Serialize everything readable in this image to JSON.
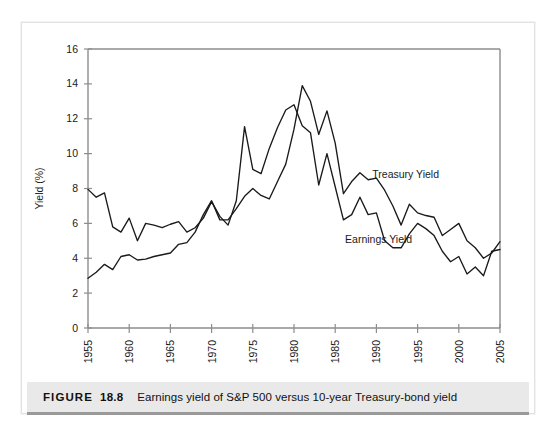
{
  "caption": {
    "figure_word": "FIGURE",
    "figure_number": "18.8",
    "text": "Earnings yield of S&P 500 versus 10-year Treasury-bond yield"
  },
  "chart_data": {
    "type": "line",
    "title": "",
    "xlabel": "",
    "ylabel": "Yield (%)",
    "xlim": [
      1955,
      2005
    ],
    "ylim": [
      0,
      16
    ],
    "yticks": [
      0,
      2,
      4,
      6,
      8,
      10,
      12,
      14,
      16
    ],
    "ytick_labels": [
      "0",
      "2",
      "4",
      "6",
      "8",
      "10",
      "12",
      "14",
      "16"
    ],
    "xticks": [
      1955,
      1960,
      1965,
      1970,
      1975,
      1980,
      1985,
      1990,
      1995,
      2000,
      2005
    ],
    "xtick_labels": [
      "1955",
      "1960",
      "1965",
      "1970",
      "1975",
      "1980",
      "1985",
      "1990",
      "1995",
      "2000",
      "2005"
    ],
    "grid": false,
    "legend": "inline-annotations",
    "x": [
      1955,
      1956,
      1957,
      1958,
      1959,
      1960,
      1961,
      1962,
      1963,
      1964,
      1965,
      1966,
      1967,
      1968,
      1969,
      1970,
      1971,
      1972,
      1973,
      1974,
      1975,
      1976,
      1977,
      1978,
      1979,
      1980,
      1981,
      1982,
      1983,
      1984,
      1985,
      1986,
      1987,
      1988,
      1989,
      1990,
      1991,
      1992,
      1993,
      1994,
      1995,
      1996,
      1997,
      1998,
      1999,
      2000,
      2001,
      2002,
      2003,
      2004,
      2005
    ],
    "series": [
      {
        "name": "Earnings Yield",
        "color": "#1a1a1a",
        "label_position": {
          "x": 1986.2,
          "y": 4.9
        },
        "values": [
          7.95,
          7.5,
          7.75,
          5.8,
          5.5,
          6.3,
          5.0,
          6.0,
          5.9,
          5.75,
          5.95,
          6.1,
          5.5,
          5.75,
          6.3,
          7.25,
          6.4,
          5.9,
          7.3,
          11.55,
          9.1,
          8.85,
          10.3,
          11.5,
          12.5,
          12.8,
          11.6,
          11.2,
          8.2,
          10.0,
          8.1,
          6.2,
          6.5,
          7.5,
          6.5,
          6.6,
          5.0,
          4.6,
          4.6,
          5.4,
          6.0,
          5.7,
          5.3,
          4.4,
          3.8,
          4.1,
          3.1,
          3.5,
          3.0,
          4.4,
          4.5
        ]
      },
      {
        "name": "Treasury Yield",
        "color": "#1a1a1a",
        "label_position": {
          "x": 1989.5,
          "y": 8.6
        },
        "values": [
          2.85,
          3.2,
          3.65,
          3.35,
          4.1,
          4.2,
          3.9,
          3.95,
          4.1,
          4.2,
          4.3,
          4.8,
          4.9,
          5.5,
          6.5,
          7.3,
          6.2,
          6.2,
          6.85,
          7.55,
          8.0,
          7.6,
          7.4,
          8.4,
          9.4,
          11.4,
          13.9,
          13.0,
          11.1,
          12.45,
          10.6,
          7.7,
          8.4,
          8.9,
          8.5,
          8.6,
          7.9,
          7.0,
          5.9,
          7.1,
          6.6,
          6.45,
          6.35,
          5.3,
          5.65,
          6.0,
          5.0,
          4.6,
          4.0,
          4.3,
          4.95
        ]
      }
    ]
  }
}
